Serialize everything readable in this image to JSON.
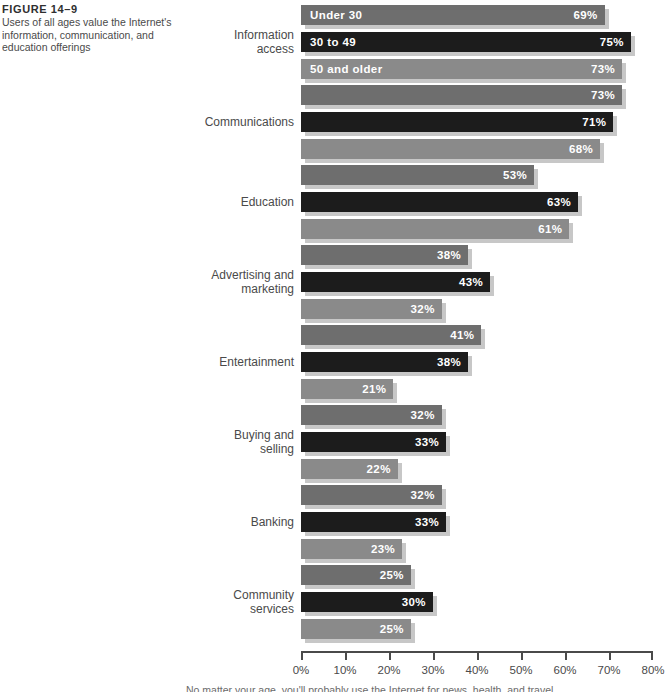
{
  "figure": {
    "number": "FIGURE 14–9",
    "description": "Users of all ages value the Internet's information, communication, and education offerings"
  },
  "footer_text": "No matter your age, you'll probably use the Internet for news, health, and travel",
  "colors": {
    "series_under_30": "#6e6e6e",
    "series_30_to_49": "#1c1c1c",
    "series_50_and_older": "#8a8a8a",
    "bar_shadow": "#c7c7c7",
    "axis": "#4a4a4a",
    "value_label": "#ffffff"
  },
  "chart_data": {
    "type": "bar",
    "orientation": "horizontal",
    "grouped": true,
    "title": "",
    "subtitle": "",
    "xlabel": "",
    "ylabel": "",
    "xlim": [
      0,
      80
    ],
    "grid": false,
    "legend_position": "inside-first-group",
    "tick_labels": [
      "0%",
      "10%",
      "20%",
      "30%",
      "40%",
      "50%",
      "60%",
      "70%",
      "80%"
    ],
    "tick_values": [
      0,
      10,
      20,
      30,
      40,
      50,
      60,
      70,
      80
    ],
    "categories": [
      "Information\naccess",
      "Communications",
      "Education",
      "Advertising and\nmarketing",
      "Entertainment",
      "Buying and\nselling",
      "Banking",
      "Community\nservices"
    ],
    "series": [
      {
        "name": "Under 30",
        "values": [
          69,
          73,
          53,
          38,
          41,
          32,
          32,
          25
        ],
        "labels": [
          "69%",
          "73%",
          "53%",
          "38%",
          "41%",
          "32%",
          "32%",
          "25%"
        ]
      },
      {
        "name": "30 to 49",
        "values": [
          75,
          71,
          63,
          43,
          38,
          33,
          33,
          30
        ],
        "labels": [
          "75%",
          "71%",
          "63%",
          "43%",
          "38%",
          "33%",
          "33%",
          "30%"
        ]
      },
      {
        "name": "50 and older",
        "values": [
          73,
          68,
          61,
          32,
          21,
          22,
          23,
          25
        ],
        "labels": [
          "73%",
          "68%",
          "61%",
          "32%",
          "21%",
          "22%",
          "23%",
          "25%"
        ]
      }
    ]
  }
}
